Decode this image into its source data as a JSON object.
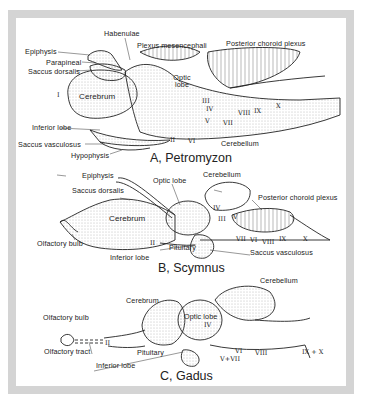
{
  "figure": {
    "panels": [
      {
        "id": "A",
        "title": "A, Petromyzon",
        "labels": {
          "habenulae": "Habenulae",
          "plexus_mesencephali": "Plexus mesencephali",
          "posterior_choroid_plexus": "Posterior choroid plexus",
          "epiphysis": "Epiphysis",
          "parapineal": "Parapineal",
          "saccus_dorsalis": "Saccus dorsalis",
          "optic_lobe": "Optic lobe",
          "cerebrum": "Cerebrum",
          "inferior_lobe": "Inferior lobe",
          "saccus_vasculosus": "Saccus vasculosus",
          "hypophysis": "Hypophysis",
          "cerebellum": "Cerebellum"
        },
        "nerves": [
          "I",
          "II",
          "III",
          "IV",
          "V",
          "VI",
          "VII",
          "VIII",
          "IX",
          "X"
        ]
      },
      {
        "id": "B",
        "title": "B, Scymnus",
        "labels": {
          "epiphysis": "Epiphysis",
          "saccus_dorsalis": "Saccus dorsalis",
          "optic_lobe": "Optic lobe",
          "cerebellum": "Cerebellum",
          "posterior_choroid_plexus": "Posterior choroid plexus",
          "cerebrum": "Cerebrum",
          "olfactory_bulb": "Olfactory bulb",
          "inferior_lobe": "Inferior lobe",
          "pituitary": "Pituitary",
          "saccus_vasculosus": "Saccus vasculosus"
        },
        "nerves": [
          "II",
          "III",
          "IV",
          "V",
          "VI",
          "VII",
          "VIII",
          "IX",
          "X"
        ]
      },
      {
        "id": "C",
        "title": "C, Gadus",
        "labels": {
          "cerebellum": "Cerebellum",
          "cerebrum": "Cerebrum",
          "olfactory_bulb": "Olfactory bulb",
          "olfactory_tract": "Olfactory tract",
          "optic_lobe": "Optic lobe",
          "pituitary": "Pituitary",
          "inferior_lobe": "Inferior lobe"
        },
        "nerves": [
          "II",
          "IV",
          "V+VII",
          "VI",
          "VIII",
          "IX + X"
        ]
      }
    ],
    "colors": {
      "frame": "#d4d4d4",
      "ink": "#222222",
      "shade": "#9a9a9a",
      "background": "#ffffff"
    }
  }
}
